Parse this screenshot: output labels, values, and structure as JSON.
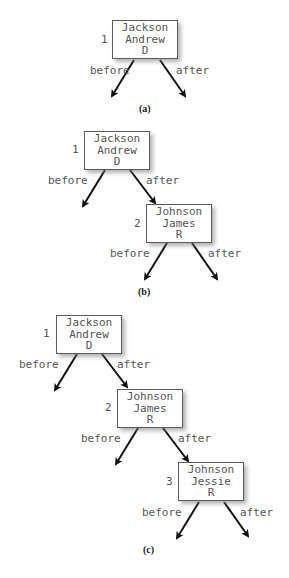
{
  "figure": {
    "panels": [
      {
        "caption": "(a)",
        "nodes": [
          {
            "index": "1",
            "last": "Jackson",
            "first": "Andrew",
            "party": "D"
          }
        ],
        "edge_labels": {
          "before": "before",
          "after": "after"
        }
      },
      {
        "caption": "(b)",
        "nodes": [
          {
            "index": "1",
            "last": "Jackson",
            "first": "Andrew",
            "party": "D"
          },
          {
            "index": "2",
            "last": "Johnson",
            "first": "James",
            "party": "R"
          }
        ],
        "edge_labels": {
          "before": "before",
          "after": "after"
        }
      },
      {
        "caption": "(c)",
        "nodes": [
          {
            "index": "1",
            "last": "Jackson",
            "first": "Andrew",
            "party": "D"
          },
          {
            "index": "2",
            "last": "Johnson",
            "first": "James",
            "party": "R"
          },
          {
            "index": "3",
            "last": "Johnson",
            "first": "Jessie",
            "party": "R"
          }
        ],
        "edge_labels": {
          "before": "before",
          "after": "after"
        }
      }
    ],
    "colors": {
      "text": "#555555",
      "border": "#5a5a5a",
      "arrow": "#111111",
      "shadow": "#9a9a9a"
    }
  }
}
